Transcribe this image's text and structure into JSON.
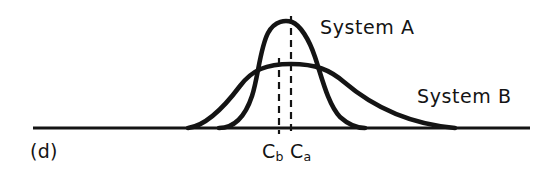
{
  "figure": {
    "panel_label": "(d)",
    "ink_color": "#141414",
    "background_color": "#ffffff"
  },
  "labels": {
    "system_a": "System A",
    "system_b": "System B",
    "cb_letter": "C",
    "cb_subscript": "b",
    "ca_letter": "C",
    "ca_subscript": "a"
  },
  "chart_data": {
    "type": "line",
    "title": "",
    "subtitle": "",
    "xlabel": "",
    "ylabel": "",
    "grid": false,
    "legend_position": "inline-annotation",
    "axis": {
      "baseline_y_px": 128,
      "baseline_x_start_px": 33,
      "baseline_x_end_px": 530,
      "xlim": [
        33,
        530
      ],
      "ylim": [
        0,
        128
      ]
    },
    "series": [
      {
        "name": "System A",
        "description": "narrow tall unimodal distribution",
        "peak_x_px": 291,
        "peak_y_px": 22,
        "left_foot_x_px": 219,
        "right_foot_x_px": 365,
        "path": "M 219 128 C 232 128 244 120 252 96 C 258 78 260 48 268 33 C 275 20 286 20 292 22 C 300 25 309 39 315 57 C 322 78 328 104 340 117 C 350 126 358 128 365 128",
        "stroke_width": 4.6
      },
      {
        "name": "System B",
        "description": "broad flat-topped distribution",
        "peak_x_px": 291,
        "peak_y_px": 64,
        "left_foot_x_px": 188,
        "right_foot_x_px": 455,
        "path": "M 188 128 C 205 126 222 110 240 86 C 252 70 266 64 291 64 C 316 64 330 70 344 82 C 372 106 410 124 455 128",
        "stroke_width": 4.6
      }
    ],
    "markers": [
      {
        "name": "Cb",
        "label": "C_b",
        "x_px": 279,
        "y_top_px": 58,
        "y_bottom_px": 134,
        "style": "dashed-vertical"
      },
      {
        "name": "Ca",
        "label": "C_a",
        "x_px": 291,
        "y_top_px": 16,
        "y_bottom_px": 134,
        "style": "dashed-vertical"
      }
    ],
    "annotations": [
      {
        "text": "System A",
        "x_px": 320,
        "y_px": 16
      },
      {
        "text": "System B",
        "x_px": 417,
        "y_px": 85
      },
      {
        "text": "(d)",
        "x_px": 30,
        "y_px": 140
      }
    ]
  }
}
